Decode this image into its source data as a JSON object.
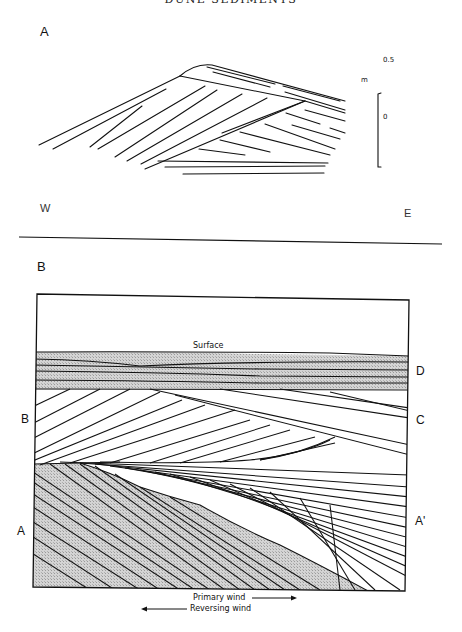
{
  "running_head": "DUNE SEDIMENTS",
  "panel_a": {
    "label": "A",
    "direction_west": "W",
    "direction_east": "E",
    "scale": {
      "unit": "m",
      "top_value": "0.5",
      "bottom_value": "0"
    }
  },
  "panel_b": {
    "label": "B",
    "surface_label": "Surface",
    "unit_labels_left": [
      "B",
      "A"
    ],
    "unit_labels_right": [
      "D",
      "C",
      "A'"
    ],
    "legend": {
      "primary_wind": "Primary wind",
      "reversing_wind": "Reversing wind"
    },
    "shade_color": "#c8c8c8",
    "line_color": "#111111"
  }
}
